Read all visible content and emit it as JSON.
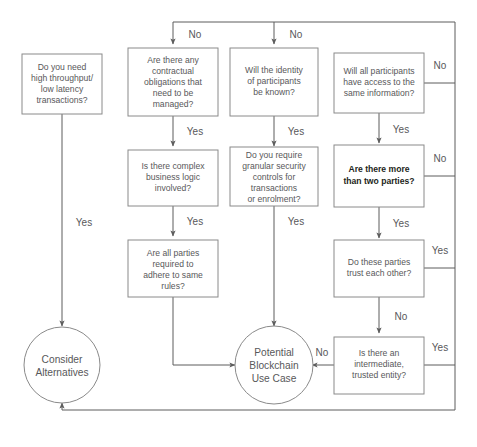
{
  "diagram": {
    "colors": {
      "box_stroke": "#8a8a8a",
      "edge_stroke": "#5d5d5d",
      "text": "#58585a",
      "emphasis_text": "#231f20",
      "background": "#ffffff"
    },
    "nodes": [
      {
        "id": "throughput",
        "shape": "box",
        "lines": [
          "Do you need",
          "high throughput/",
          "low latency",
          "transactions?"
        ]
      },
      {
        "id": "contractual",
        "shape": "box",
        "lines": [
          "Are there any",
          "contractual",
          "obligations that",
          "need to be",
          "managed?"
        ]
      },
      {
        "id": "identity",
        "shape": "box",
        "lines": [
          "Will the identity",
          "of participants",
          "be known?"
        ]
      },
      {
        "id": "access",
        "shape": "box",
        "lines": [
          "Will all participants",
          "have access to the",
          "same information?"
        ]
      },
      {
        "id": "business-logic",
        "shape": "box",
        "lines": [
          "Is there complex",
          "business logic",
          "involved?"
        ]
      },
      {
        "id": "granular-security",
        "shape": "box",
        "lines": [
          "Do you require",
          "granular security",
          "controls for",
          "transactions",
          "or enrolment?"
        ]
      },
      {
        "id": "two-parties",
        "shape": "box",
        "emphasis": true,
        "lines": [
          "Are there more",
          "than two parties?"
        ]
      },
      {
        "id": "same-rules",
        "shape": "box",
        "lines": [
          "Are all parties",
          "required to",
          "adhere to same",
          "rules?"
        ]
      },
      {
        "id": "trust",
        "shape": "box",
        "lines": [
          "Do these parties",
          "trust each other?"
        ]
      },
      {
        "id": "intermediate",
        "shape": "box",
        "lines": [
          "Is there an",
          "intermediate,",
          "trusted entity?"
        ]
      },
      {
        "id": "consider-alternatives",
        "shape": "circle",
        "lines": [
          "Consider",
          "Alternatives"
        ]
      },
      {
        "id": "potential-blockchain",
        "shape": "circle",
        "lines": [
          "Potential",
          "Blockchain",
          "Use Case"
        ]
      }
    ],
    "edge_labels": [
      {
        "id": "no-to-contractual",
        "text": "No"
      },
      {
        "id": "no-to-identity",
        "text": "No"
      },
      {
        "id": "no-access-right",
        "text": "No"
      },
      {
        "id": "yes-throughput",
        "text": "Yes"
      },
      {
        "id": "yes-contractual",
        "text": "Yes"
      },
      {
        "id": "yes-identity",
        "text": "Yes"
      },
      {
        "id": "yes-access",
        "text": "Yes"
      },
      {
        "id": "yes-business-logic",
        "text": "Yes"
      },
      {
        "id": "yes-granular-security",
        "text": "Yes"
      },
      {
        "id": "no-two-parties-right",
        "text": "No"
      },
      {
        "id": "yes-two-parties",
        "text": "Yes"
      },
      {
        "id": "yes-trust-right",
        "text": "Yes"
      },
      {
        "id": "no-trust",
        "text": "No"
      },
      {
        "id": "yes-intermediate-right",
        "text": "Yes"
      },
      {
        "id": "no-intermediate",
        "text": "No"
      }
    ]
  }
}
